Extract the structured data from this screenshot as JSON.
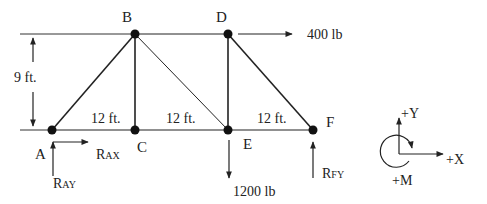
{
  "diagram": {
    "type": "truss",
    "joints": [
      {
        "id": "A",
        "label": "A",
        "x": 52,
        "y": 130
      },
      {
        "id": "B",
        "label": "B",
        "x": 135,
        "y": 34
      },
      {
        "id": "C",
        "label": "C",
        "x": 135,
        "y": 130
      },
      {
        "id": "D",
        "label": "D",
        "x": 228,
        "y": 34
      },
      {
        "id": "E",
        "label": "E",
        "x": 228,
        "y": 130
      },
      {
        "id": "F",
        "label": "F",
        "x": 313,
        "y": 130
      }
    ],
    "members": [
      "AB",
      "AC",
      "BC",
      "BE",
      "CE",
      "BD",
      "DE",
      "DF",
      "EF"
    ],
    "dimensions": {
      "height": "9 ft.",
      "span_AC": "12 ft.",
      "span_CE": "12 ft.",
      "span_EF": "12 ft."
    },
    "loads": {
      "D_horizontal": "400 lb",
      "E_vertical": "1200 lb"
    },
    "reactions": {
      "RAX": {
        "main": "R",
        "sub": "AX"
      },
      "RAY": {
        "main": "R",
        "sub": "AY"
      },
      "RFY": {
        "main": "R",
        "sub": "FY"
      }
    },
    "axes": {
      "y": "+Y",
      "x": "+X",
      "m": "+M"
    }
  }
}
